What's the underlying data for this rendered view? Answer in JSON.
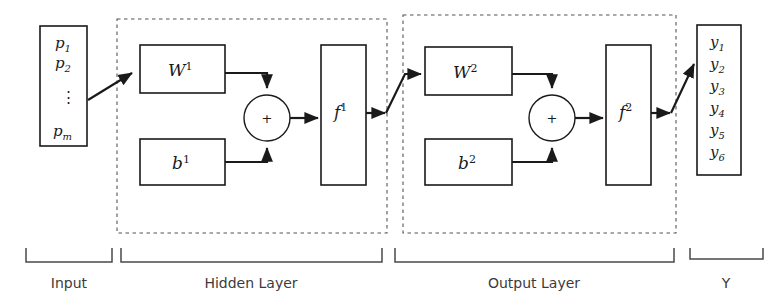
{
  "diagram": {
    "input_vector": {
      "name": "input-vector",
      "entries": [
        {
          "base": "p",
          "sub": "1"
        },
        {
          "base": "p",
          "sub": "2"
        },
        {
          "base": "p",
          "sub": "m"
        }
      ],
      "ellipsis": "⋮"
    },
    "output_vector": {
      "name": "output-vector",
      "entries": [
        {
          "base": "y",
          "sub": "1"
        },
        {
          "base": "y",
          "sub": "2"
        },
        {
          "base": "y",
          "sub": "3"
        },
        {
          "base": "y",
          "sub": "4"
        },
        {
          "base": "y",
          "sub": "5"
        },
        {
          "base": "y",
          "sub": "6"
        }
      ]
    },
    "hidden_layer": {
      "weight": {
        "base": "W",
        "sup": "1"
      },
      "bias": {
        "base": "b",
        "sup": "1"
      },
      "transfer": {
        "base": "f",
        "sup": "1"
      },
      "sum_symbol": "+"
    },
    "output_layer": {
      "weight": {
        "base": "W",
        "sup": "2"
      },
      "bias": {
        "base": "b",
        "sup": "2"
      },
      "transfer": {
        "base": "f",
        "sup": "2"
      },
      "sum_symbol": "+"
    },
    "section_labels": {
      "input": "Input",
      "hidden": "Hidden Layer",
      "output": "Output Layer",
      "result": "Y"
    },
    "colors": {
      "line": "#1a1a1a",
      "dashed_group": "#555555",
      "brace": "#4a4a4a",
      "label_text": "#3b3b3b",
      "background": "#ffffff"
    }
  }
}
